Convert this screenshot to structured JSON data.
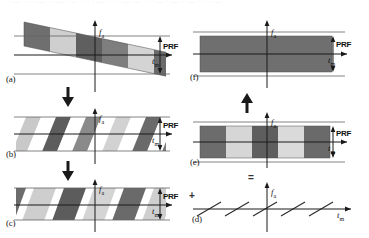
{
  "figure": {
    "caption_strip": "· · — ·· ·· — ·· — · — ·· · · — ·· ·· —· — · ·· — · — ·· — · · ·· —",
    "axis": {
      "y_label": "f",
      "y_sub": "a",
      "x_label": "t",
      "x_sub": "m"
    },
    "prf_label": "PRF",
    "operators": {
      "plus": "+",
      "equals": "="
    },
    "flow_arrows": {
      "down": "↓",
      "up": "↑"
    },
    "panels": [
      {
        "id": "a",
        "label": "(a)",
        "description": "continuous slanted azimuth-frequency band crossing PRF bounds",
        "content_type": "slanted-band"
      },
      {
        "id": "b",
        "label": "(b)",
        "description": "band wrapped into PRF interval as repeating slanted stripes",
        "content_type": "wrapped-stripes"
      },
      {
        "id": "c",
        "label": "(c)",
        "description": "parallelogram blocks inside PRF interval",
        "content_type": "parallelogram-blocks"
      },
      {
        "id": "d",
        "label": "(d)",
        "description": "residual linear chirp slope segments",
        "content_type": "slope-lines"
      },
      {
        "id": "e",
        "label": "(e)",
        "description": "alternating dark and light rectangular blocks within PRF band",
        "content_type": "rect-blocks"
      },
      {
        "id": "f",
        "label": "(f)",
        "description": "uniform filled rectangular band filling the PRF interval",
        "content_type": "solid-band"
      }
    ],
    "colors": {
      "dark_block": "#6e6e6e",
      "mid_block": "#8d8d8d",
      "light_block": "#d2d2d2",
      "axis": "#1a1a1a",
      "guide_line": "#6a6a6a"
    }
  }
}
